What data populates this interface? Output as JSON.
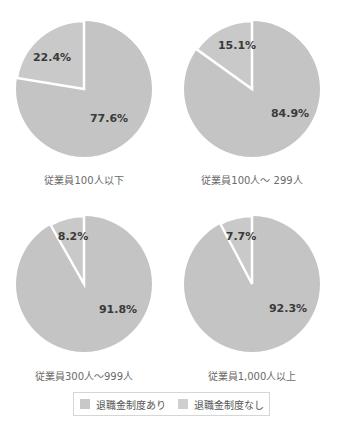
{
  "chart_data": [
    {
      "type": "pie",
      "title": "従業員100人以下",
      "categories": [
        "退職金制度あり",
        "退職金制度なし"
      ],
      "values": [
        77.6,
        22.4
      ],
      "labels": [
        "77.6%",
        "22.4%"
      ]
    },
    {
      "type": "pie",
      "title": "従業員100人～299人",
      "categories": [
        "退職金制度あり",
        "退職金制度なし"
      ],
      "values": [
        84.9,
        15.1
      ],
      "labels": [
        "84.9%",
        "15.1%"
      ]
    },
    {
      "type": "pie",
      "title": "従業員300人～999人",
      "categories": [
        "退職金制度あり",
        "退職金制度なし"
      ],
      "values": [
        91.8,
        8.2
      ],
      "labels": [
        "91.8%",
        "8.2%"
      ]
    },
    {
      "type": "pie",
      "title": "従業員1,000人以上",
      "categories": [
        "退職金制度あり",
        "退職金制度なし"
      ],
      "values": [
        92.3,
        7.7
      ],
      "labels": [
        "92.3%",
        "7.7%"
      ]
    }
  ],
  "pies": [
    {
      "caption": "従業員100人以下",
      "yes_label": "77.6%",
      "no_label": "22.4%",
      "no_pct": 22.4
    },
    {
      "caption": "従業員100人～ 299人",
      "yes_label": "84.9%",
      "no_label": "15.1%",
      "no_pct": 15.1
    },
    {
      "caption": "従業員300人～999人",
      "yes_label": "91.8%",
      "no_label": "8.2%",
      "no_pct": 8.2
    },
    {
      "caption": "従業員1,000人以上",
      "yes_label": "92.3%",
      "no_label": "7.7%",
      "no_pct": 7.7
    }
  ],
  "legend": {
    "items": [
      {
        "label": "退職金制度あり",
        "color": "#c8c8c8"
      },
      {
        "label": "退職金制度なし",
        "color": "#cfcfcf"
      }
    ]
  },
  "colors": {
    "slice_yes": "#c4c4c4",
    "slice_no": "#c9c9c9",
    "separator": "#ffffff"
  }
}
